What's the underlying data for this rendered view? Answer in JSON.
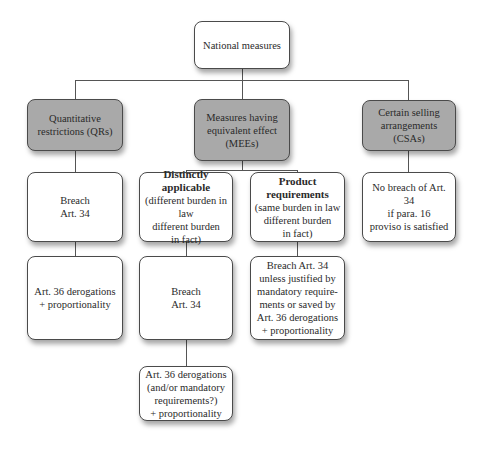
{
  "diagram": {
    "root": {
      "label": "National measures"
    },
    "categories": [
      {
        "id": "qr",
        "lines": [
          "Quantitative",
          "restrictions (QRs)"
        ]
      },
      {
        "id": "mee",
        "lines": [
          "Measures having",
          "equivalent effect",
          "(MEEs)"
        ]
      },
      {
        "id": "csa",
        "lines": [
          "Certain selling",
          "arrangements (CSAs)"
        ]
      }
    ],
    "qr_branch": {
      "step1": {
        "lines": [
          "Breach",
          "Art. 34"
        ]
      },
      "step2": {
        "lines": [
          "Art. 36 derogations",
          "+ proportionality"
        ]
      }
    },
    "mee_branch": {
      "distinctly_applicable": {
        "title_lines": [
          "Distinctly",
          "applicable"
        ],
        "sub_lines": [
          "(different burden in law",
          "different burden",
          "in fact)"
        ],
        "step2": {
          "lines": [
            "Breach",
            "Art. 34"
          ]
        },
        "step3": {
          "lines": [
            "Art. 36 derogations",
            "(and/or mandatory",
            "requirements?)",
            "+ proportionality"
          ]
        }
      },
      "product_requirements": {
        "title_lines": [
          "Product",
          "requirements"
        ],
        "sub_lines": [
          "(same burden in law",
          "different burden",
          "in fact)"
        ],
        "step2": {
          "lines": [
            "Breach Art. 34",
            "unless justified by",
            "mandatory require-",
            "ments or saved by",
            "Art. 36 derogations",
            "+ proportionality"
          ]
        }
      }
    },
    "csa_branch": {
      "step1": {
        "lines": [
          "No breach of Art. 34",
          "if para. 16",
          "proviso is satisfied"
        ]
      }
    },
    "colors": {
      "category_fill": "#a9a9a9",
      "box_fill": "#ffffff",
      "border": "#4a4a4a",
      "connector": "#555555"
    }
  }
}
